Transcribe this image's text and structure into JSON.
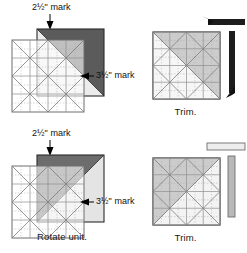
{
  "figure": {
    "background": "#ffffff",
    "colors": {
      "ruler_line": "#8a8a8a",
      "ruler_fill": "#f4f4f4",
      "fabric_dark": "#585858",
      "fabric_mid": "#9b9b9b",
      "fabric_light": "#d8d8d8",
      "trim_bar_dark": "#1d1d1d",
      "trim_bar_light": "#e4e4e4",
      "text": "#111111",
      "leader": "#000000"
    }
  },
  "panels": [
    {
      "id": "top-left",
      "caption": "",
      "labels": [
        {
          "name": "mark-2-5",
          "text": "2½\" mark",
          "pointer": "down"
        },
        {
          "name": "mark-3-5",
          "text": "3½\" mark",
          "pointer": "left"
        }
      ],
      "unit": {
        "dark_corner": "top-right",
        "diagonal": "tl-br",
        "ruler_overlay": true,
        "trim_bars": []
      }
    },
    {
      "id": "top-right",
      "caption": "Trim.",
      "labels": [],
      "unit": {
        "dark_corner": "top-right",
        "diagonal": "tl-br",
        "ruler_overlay": true,
        "trim_bars": [
          {
            "name": "trim-bar-top",
            "orientation": "horizontal",
            "style": "dark",
            "arrow": "left"
          },
          {
            "name": "trim-bar-right",
            "orientation": "vertical",
            "style": "dark",
            "arrow": "down"
          }
        ]
      }
    },
    {
      "id": "bottom-left",
      "caption": "Rotate unit.",
      "labels": [
        {
          "name": "mark-2-5",
          "text": "2½\" mark",
          "pointer": "down"
        },
        {
          "name": "mark-3-5",
          "text": "3½\" mark",
          "pointer": "left"
        }
      ],
      "unit": {
        "dark_corner": "bottom-left",
        "diagonal": "tr-bl",
        "ruler_overlay": true,
        "trim_bars": []
      }
    },
    {
      "id": "bottom-right",
      "caption": "Trim.",
      "labels": [],
      "unit": {
        "dark_corner": "bottom-left",
        "diagonal": "tr-bl",
        "ruler_overlay": true,
        "trim_bars": [
          {
            "name": "trim-bar-top",
            "orientation": "horizontal",
            "style": "light",
            "arrow": "none"
          },
          {
            "name": "trim-bar-right",
            "orientation": "vertical",
            "style": "light",
            "arrow": "none"
          }
        ]
      }
    }
  ],
  "ruler": {
    "name": "square-quilting-ruler",
    "major_divisions": 4,
    "minor_divisions": 8,
    "diagonals": [
      "tl-br",
      "tr-bl",
      "45-left",
      "45-right"
    ]
  }
}
